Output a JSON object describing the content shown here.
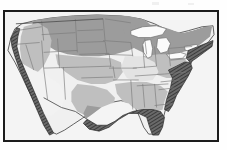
{
  "figure": {
    "kind": "thematic-map",
    "region": "Contiguous United States",
    "title": "",
    "caption": "",
    "frame": {
      "x": 3,
      "y": 10,
      "width": 216,
      "height": 132,
      "border_color": "#1b1b1b"
    },
    "background_color": "#fefefe"
  },
  "legend": {
    "visible": false,
    "entries": [
      {
        "id": "zone-none",
        "label": "",
        "color": "#f2f2f2"
      },
      {
        "id": "zone-light",
        "label": "",
        "color": "#e2e2e2"
      },
      {
        "id": "zone-medium",
        "label": "",
        "color": "#bdbdbd"
      },
      {
        "id": "zone-dark",
        "label": "",
        "color": "#9a9a9a"
      },
      {
        "id": "zone-coastal-band",
        "label": "",
        "color": "#4a4a4a"
      }
    ]
  },
  "map": {
    "ocean_color": "#f4f4f4",
    "land_base_color": "#f0f0f0",
    "state_border_color": "#7a7a7a",
    "country_border_color": "#555555",
    "coast_outline_color": "#3b3b3b",
    "lake_color": "#fbfbfb",
    "lake_outline_color": "#6f6f6f",
    "shading_levels": {
      "light": "#e3e3e3",
      "medium": "#bfbfbf",
      "dark": "#9c9c9c",
      "band": "#4f4f4f"
    },
    "features": [
      {
        "name": "great-lakes",
        "type": "water",
        "visible": true
      },
      {
        "name": "pacific-coastal-band",
        "type": "band",
        "visible": true
      },
      {
        "name": "gulf-coastal-band",
        "type": "band",
        "visible": true
      },
      {
        "name": "atlantic-coastal-band",
        "type": "band",
        "visible": true
      },
      {
        "name": "northeast-coastal-band",
        "type": "band",
        "visible": true
      },
      {
        "name": "northern-plains-zone",
        "type": "shaded-region",
        "shade": "dark",
        "visible": true
      },
      {
        "name": "great-lakes-zone",
        "type": "shaded-region",
        "shade": "dark",
        "visible": true
      },
      {
        "name": "appalachian-zone",
        "type": "shaded-region",
        "shade": "medium",
        "visible": true
      },
      {
        "name": "southeast-zone",
        "type": "shaded-region",
        "shade": "medium",
        "visible": true
      },
      {
        "name": "southwest-zone",
        "type": "shaded-region",
        "shade": "light",
        "visible": true
      },
      {
        "name": "texas-zone",
        "type": "shaded-region",
        "shade": "medium",
        "visible": true
      }
    ]
  }
}
